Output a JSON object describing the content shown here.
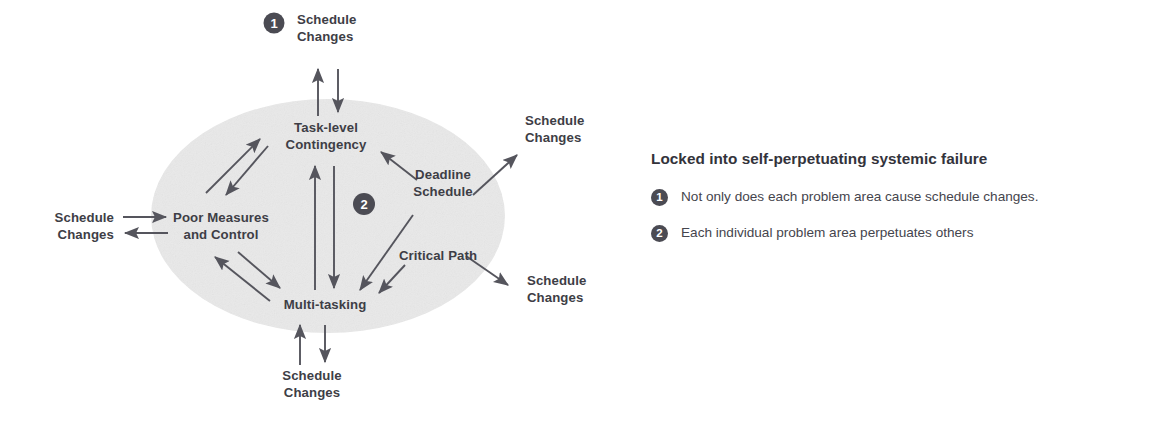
{
  "diagram": {
    "type": "causal-loop-diagram",
    "title_present": false,
    "cluster": {
      "shape": "ellipse",
      "fill_color": "#e9e9e9",
      "nodes": [
        {
          "id": "task-level-contingency",
          "label_line1": "Task-level",
          "label_line2": "Contingency"
        },
        {
          "id": "poor-measures-and-control",
          "label_line1": "Poor Measures",
          "label_line2": "and Control"
        },
        {
          "id": "multi-tasking",
          "label_line1": "Multi-tasking",
          "label_line2": ""
        },
        {
          "id": "deadline-schedule",
          "label_line1": "Deadline",
          "label_line2": "Schedule"
        },
        {
          "id": "critical-path",
          "label_line1": "Critical Path",
          "label_line2": ""
        }
      ]
    },
    "external_labels": [
      {
        "id": "schedule-changes-top",
        "line1": "Schedule",
        "line2": "Changes",
        "badge": "1"
      },
      {
        "id": "schedule-changes-left",
        "line1": "Schedule",
        "line2": "Changes",
        "badge": ""
      },
      {
        "id": "schedule-changes-top-right",
        "line1": "Schedule",
        "line2": "Changes",
        "badge": ""
      },
      {
        "id": "schedule-changes-bottom-right",
        "line1": "Schedule",
        "line2": "Changes",
        "badge": ""
      },
      {
        "id": "schedule-changes-bottom",
        "line1": "Schedule",
        "line2": "Changes",
        "badge": ""
      }
    ],
    "badges": [
      {
        "id": "badge-one",
        "value": "1"
      },
      {
        "id": "badge-two",
        "value": "2"
      }
    ],
    "arrow_color": "#55555d",
    "text_color": "#3e3e46"
  },
  "legend": {
    "heading": "Locked into self-perpetuating systemic failure",
    "items": [
      {
        "number": "1",
        "text": "Not only does each problem area cause schedule changes."
      },
      {
        "number": "2",
        "text": "Each individual problem area perpetuates others"
      }
    ]
  }
}
